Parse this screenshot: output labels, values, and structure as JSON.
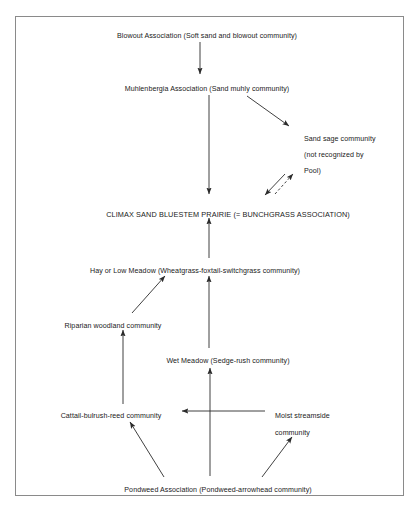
{
  "diagram": {
    "frame": {
      "stroke": "#8a8a8a"
    },
    "line_color": "#2b2b2b",
    "nodes": [
      {
        "id": "blowout",
        "label": "Blowout Association (Soft sand and blowout community)",
        "x": 207,
        "y": 31
      },
      {
        "id": "muhlenbergia",
        "label": "Muhlenbergia Association (Sand muhly community)",
        "x": 207,
        "y": 84
      },
      {
        "id": "sandsage_l1",
        "label": "Sand sage community",
        "x": 304,
        "y": 134
      },
      {
        "id": "sandsage_l2",
        "label": "(not recognized by",
        "x": 304,
        "y": 150
      },
      {
        "id": "sandsage_l3",
        "label": "Pool)",
        "x": 304,
        "y": 166
      },
      {
        "id": "climax",
        "label": "CLIMAX SAND BLUESTEM PRAIRIE (= BUNCHGRASS ASSOCIATION)",
        "x": 228,
        "y": 209
      },
      {
        "id": "hay_meadow",
        "label": "Hay or Low Meadow (Wheatgrass-foxtail-switchgrass community)",
        "x": 195,
        "y": 266
      },
      {
        "id": "riparian",
        "label": "Riparian woodland community",
        "x": 113,
        "y": 321
      },
      {
        "id": "wet_meadow",
        "label": "Wet Meadow (Sedge-rush community)",
        "x": 228,
        "y": 356
      },
      {
        "id": "cattail",
        "label": "Cattail-bulrush-reed community",
        "x": 111,
        "y": 411
      },
      {
        "id": "moist_streamside_l1",
        "label": "Moist streamside",
        "x": 306,
        "y": 411
      },
      {
        "id": "moist_streamside_l2",
        "label": "community",
        "x": 306,
        "y": 428
      },
      {
        "id": "pondweed",
        "label": "Pondweed Association (Pondweed-arrowhead community)",
        "x": 218,
        "y": 485
      }
    ],
    "edges": [
      {
        "id": "blowout-to-muhlenbergia",
        "from": "blowout",
        "to": "muhlenbergia",
        "style": "solid"
      },
      {
        "id": "muhlenbergia-to-climax",
        "from": "muhlenbergia",
        "to": "climax",
        "style": "solid"
      },
      {
        "id": "muhlenbergia-to-sandsage",
        "from": "muhlenbergia",
        "to": "sandsage",
        "style": "solid"
      },
      {
        "id": "sandsage-to-climax",
        "from": "sandsage",
        "to": "climax",
        "style": "solid"
      },
      {
        "id": "climax-to-sandsage-dashed",
        "from": "climax",
        "to": "sandsage",
        "style": "dashed"
      },
      {
        "id": "hay-meadow-to-climax",
        "from": "hay_meadow",
        "to": "climax",
        "style": "solid"
      },
      {
        "id": "riparian-to-hay-meadow",
        "from": "riparian",
        "to": "hay_meadow",
        "style": "solid"
      },
      {
        "id": "wet-meadow-to-hay-meadow",
        "from": "wet_meadow",
        "to": "hay_meadow",
        "style": "solid"
      },
      {
        "id": "cattail-to-riparian",
        "from": "cattail",
        "to": "riparian",
        "style": "solid"
      },
      {
        "id": "moist-streamside-to-cattail",
        "from": "moist_streamside",
        "to": "cattail",
        "style": "solid"
      },
      {
        "id": "pondweed-to-wet-meadow",
        "from": "pondweed",
        "to": "wet_meadow",
        "style": "solid"
      },
      {
        "id": "pondweed-to-cattail",
        "from": "pondweed",
        "to": "cattail",
        "style": "solid"
      },
      {
        "id": "pondweed-to-moist-streamside",
        "from": "pondweed",
        "to": "moist_streamside",
        "style": "solid"
      }
    ]
  }
}
